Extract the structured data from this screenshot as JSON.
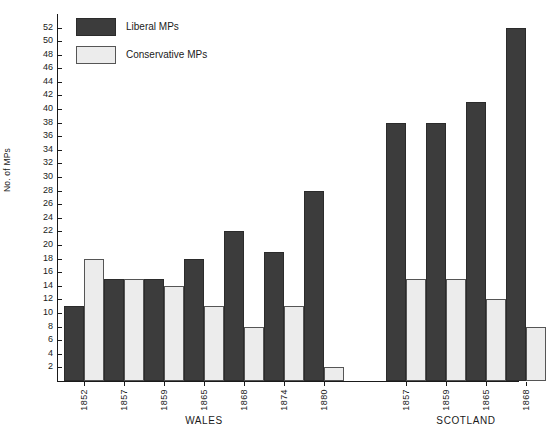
{
  "chart_data": {
    "type": "bar",
    "title": "",
    "xlabel": "",
    "ylabel": "No. of MPs",
    "ylim": [
      0,
      52
    ],
    "ytick_step": 2,
    "yticks": [
      52,
      50,
      48,
      46,
      44,
      42,
      40,
      38,
      36,
      34,
      32,
      30,
      28,
      26,
      24,
      22,
      20,
      18,
      16,
      14,
      12,
      10,
      8,
      6,
      4,
      2
    ],
    "grid": false,
    "legend_position": "top-left",
    "legend": [
      {
        "name": "Liberal MPs",
        "color": "#3c3c3c"
      },
      {
        "name": "Conservative MPs",
        "color": "#ececec"
      }
    ],
    "groups": [
      {
        "name": "WALES",
        "categories": [
          "1852",
          "1857",
          "1859",
          "1865",
          "1868",
          "1874",
          "1880"
        ],
        "series": [
          {
            "name": "Liberal MPs",
            "values": [
              11,
              15,
              15,
              18,
              22,
              19,
              28
            ]
          },
          {
            "name": "Conservative MPs",
            "values": [
              18,
              15,
              14,
              11,
              8,
              11,
              2
            ]
          }
        ]
      },
      {
        "name": "SCOTLAND",
        "categories": [
          "1857",
          "1859",
          "1865",
          "1868"
        ],
        "series": [
          {
            "name": "Liberal MPs",
            "values": [
              38,
              38,
              41,
              52
            ]
          },
          {
            "name": "Conservative MPs",
            "values": [
              15,
              15,
              12,
              8
            ]
          }
        ]
      }
    ]
  }
}
